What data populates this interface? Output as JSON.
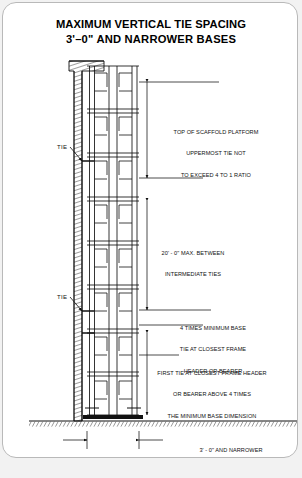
{
  "document": {
    "title_line1": "MAXIMUM VERTICAL TIE SPACING",
    "title_line2": "3'–0\" AND NARROWER BASES"
  },
  "diagram": {
    "name": "scaffold-vertical-tie-spacing-elevation",
    "tie_labels": [
      {
        "id": "tie-upper",
        "text": "TIE"
      },
      {
        "id": "tie-lower",
        "text": "TIE"
      }
    ],
    "annotations": [
      {
        "id": "top-of-scaffold-platform-note",
        "lines": [
          "TOP OF SCAFFOLD PLATFORM",
          "UPPERMOST TIE NOT",
          "TO EXCEED 4 TO 1 RATIO"
        ]
      },
      {
        "id": "intermediate-tie-spacing-note",
        "lines": [
          "20' - 0\" MAX. BETWEEN",
          "INTERMEDIATE TIES"
        ]
      },
      {
        "id": "four-times-minimum-base-note",
        "lines": [
          "4 TIMES MINIMUM BASE",
          "TIE AT CLOSEST FRAME",
          "HEADER OR BEARER"
        ]
      },
      {
        "id": "first-tie-note",
        "lines": [
          "FIRST TIE AT CLOSEST FRAME HEADER",
          "OR BEARER ABOVE 4 TIMES",
          "THE MINIMUM BASE DIMENSION"
        ]
      },
      {
        "id": "minimum-base-dimension-note",
        "lines": [
          "3' - 0\" AND NARROWER",
          "MINIMUM BASE DIMENSION"
        ]
      }
    ],
    "colors": {
      "line": "#111111",
      "hatch": "#555555",
      "paper": "#ffffff",
      "page_background": "#f2f2f2",
      "card_border": "#b9b9b9"
    }
  }
}
